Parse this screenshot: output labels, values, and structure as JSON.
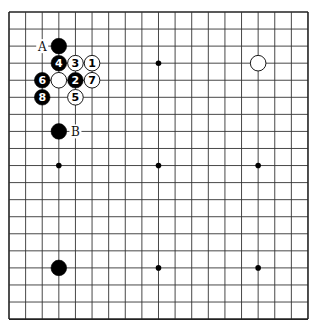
{
  "board": {
    "size": 19,
    "origin_x": 9,
    "origin_y": 12,
    "spacing_x": 16.61,
    "spacing_y": 17.06,
    "line_color": "#333333",
    "border_color": "#222222",
    "background": "#ffffff",
    "star_points": [
      [
        3,
        3
      ],
      [
        9,
        3
      ],
      [
        15,
        3
      ],
      [
        3,
        9
      ],
      [
        9,
        9
      ],
      [
        15,
        9
      ],
      [
        3,
        15
      ],
      [
        9,
        15
      ],
      [
        15,
        15
      ]
    ]
  },
  "stones": [
    {
      "col": 3,
      "row": 2,
      "color": "black",
      "label": ""
    },
    {
      "col": 3,
      "row": 3,
      "color": "black",
      "label": "4"
    },
    {
      "col": 4,
      "row": 3,
      "color": "white",
      "label": "3"
    },
    {
      "col": 5,
      "row": 3,
      "color": "white",
      "label": "1"
    },
    {
      "col": 2,
      "row": 4,
      "color": "black",
      "label": "6"
    },
    {
      "col": 3,
      "row": 4,
      "color": "white",
      "label": ""
    },
    {
      "col": 4,
      "row": 4,
      "color": "black",
      "label": "2"
    },
    {
      "col": 5,
      "row": 4,
      "color": "white",
      "label": "7"
    },
    {
      "col": 2,
      "row": 5,
      "color": "black",
      "label": "8"
    },
    {
      "col": 4,
      "row": 5,
      "color": "white",
      "label": "5"
    },
    {
      "col": 3,
      "row": 7,
      "color": "black",
      "label": ""
    },
    {
      "col": 15,
      "row": 3,
      "color": "white",
      "label": ""
    },
    {
      "col": 3,
      "row": 15,
      "color": "black",
      "label": ""
    }
  ],
  "markers": [
    {
      "col": 2,
      "row": 2,
      "text": "A"
    },
    {
      "col": 4,
      "row": 7,
      "text": "B"
    }
  ]
}
